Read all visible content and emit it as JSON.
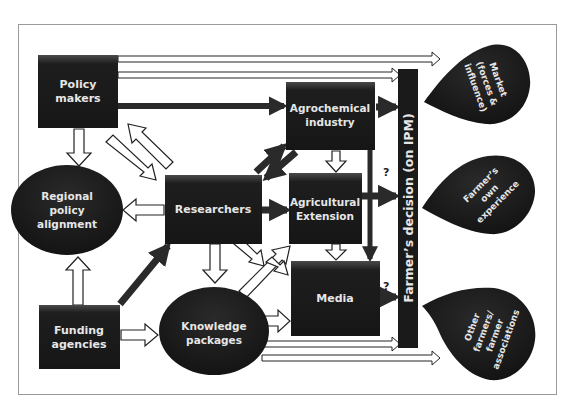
{
  "diagram": {
    "nodes": {
      "policy_makers": {
        "line1": "Policy",
        "line2": "makers",
        "shape": "box"
      },
      "regional_policy": {
        "line1": "Regional",
        "line2": "policy",
        "line3": "alignment",
        "shape": "ellipse"
      },
      "researchers": {
        "line1": "Researchers",
        "shape": "box"
      },
      "funding_agencies": {
        "line1": "Funding",
        "line2": "agencies",
        "shape": "box"
      },
      "knowledge_packages": {
        "line1": "Knowledge",
        "line2": "packages",
        "shape": "ellipse"
      },
      "agrochemical": {
        "line1": "Agrochemical",
        "line2": "industry",
        "shape": "box"
      },
      "extension": {
        "line1": "Agricultural",
        "line2": "Extension",
        "shape": "box"
      },
      "media": {
        "line1": "Media",
        "shape": "box"
      },
      "decision": {
        "label": "Farmer’s decision (on IPM)",
        "shape": "vertical-bar"
      },
      "market": {
        "line1": "Market",
        "line2": "(forces &",
        "line3": "influence)",
        "shape": "teardrop"
      },
      "own_experience": {
        "line1": "Farmer’s",
        "line2": "own",
        "line3": "experience",
        "shape": "teardrop"
      },
      "other_farmers": {
        "line1": "Other",
        "line2": "farmers/",
        "line3": "farmer",
        "line4": "associations",
        "shape": "teardrop"
      }
    },
    "annotations": {
      "q_extension": "?",
      "q_media": "?"
    },
    "edges": [
      {
        "from": "policy_makers",
        "to": "market",
        "style": "outline-double"
      },
      {
        "from": "policy_makers",
        "to": "decision",
        "style": "outline-double"
      },
      {
        "from": "policy_makers",
        "to": "agrochemical",
        "style": "solid"
      },
      {
        "from": "policy_makers",
        "to": "regional_policy",
        "style": "outline"
      },
      {
        "from": "policy_makers",
        "to": "researchers",
        "style": "outline"
      },
      {
        "from": "researchers",
        "to": "policy_makers",
        "style": "outline"
      },
      {
        "from": "researchers",
        "to": "regional_policy",
        "style": "outline"
      },
      {
        "from": "researchers",
        "to": "agrochemical",
        "style": "solid"
      },
      {
        "from": "agrochemical",
        "to": "researchers",
        "style": "solid"
      },
      {
        "from": "researchers",
        "to": "extension",
        "style": "solid"
      },
      {
        "from": "researchers",
        "to": "knowledge_packages",
        "style": "outline"
      },
      {
        "from": "researchers",
        "to": "media",
        "style": "outline"
      },
      {
        "from": "knowledge_packages",
        "to": "extension",
        "style": "outline"
      },
      {
        "from": "knowledge_packages",
        "to": "media",
        "style": "outline"
      },
      {
        "from": "knowledge_packages",
        "to": "decision",
        "style": "outline-double"
      },
      {
        "from": "knowledge_packages",
        "to": "other_farmers",
        "style": "outline-double"
      },
      {
        "from": "funding_agencies",
        "to": "regional_policy",
        "style": "outline"
      },
      {
        "from": "funding_agencies",
        "to": "researchers",
        "style": "solid"
      },
      {
        "from": "funding_agencies",
        "to": "knowledge_packages",
        "style": "outline"
      },
      {
        "from": "agrochemical",
        "to": "extension",
        "style": "outline"
      },
      {
        "from": "agrochemical",
        "to": "media",
        "style": "solid"
      },
      {
        "from": "agrochemical",
        "to": "decision",
        "style": "solid"
      },
      {
        "from": "extension",
        "to": "media",
        "style": "outline"
      },
      {
        "from": "extension",
        "to": "decision",
        "style": "solid",
        "label": "?"
      },
      {
        "from": "media",
        "to": "decision",
        "style": "solid",
        "label": "?"
      }
    ],
    "colors": {
      "node_fill": "#1e1e1e",
      "node_text": "#e6e6e6",
      "arrow_solid": "#2a2a2a",
      "frame": "#9a9a9a",
      "background": "#ffffff"
    }
  }
}
